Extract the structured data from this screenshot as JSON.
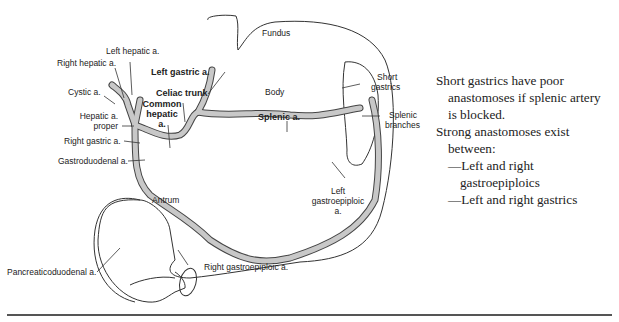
{
  "figure": {
    "regions": {
      "fundus": "Fundus",
      "body": "Body",
      "antrum": "Antrum"
    },
    "labels": {
      "left_hepatic": "Left hepatic a.",
      "right_hepatic": "Right hepatic a.",
      "left_gastric": "Left gastric a.",
      "cystic": "Cystic a.",
      "celiac_trunk": "Celiac trunk",
      "common_hepatic_1": "Common",
      "common_hepatic_2": "hepatic",
      "common_hepatic_3": "a.",
      "hepatic_proper_1": "Hepatic a.",
      "hepatic_proper_2": "proper",
      "right_gastric": "Right gastric a.",
      "gastroduodenal": "Gastroduodenal a.",
      "splenic": "Splenic a.",
      "short_gastrics_1": "Short",
      "short_gastrics_2": "gastrics",
      "splenic_branches_1": "Splenic",
      "splenic_branches_2": "branches",
      "left_gastroepiploic_1": "Left",
      "left_gastroepiploic_2": "gastroepiploic",
      "left_gastroepiploic_3": "a.",
      "pancreaticoduodenal": "Pancreaticoduodenal a.",
      "right_gastroepiploic": "Right gastroepiploic a."
    }
  },
  "notes": {
    "line1": "Short gastrics have poor",
    "line2": "anastomoses if splenic artery",
    "line3": "is blocked.",
    "line4": "Strong anastomoses exist",
    "line5": "between:",
    "line6": "—Left and right",
    "line7": "gastroepiploics",
    "line8": "—Left and right gastrics"
  },
  "colors": {
    "artery_fill": "#c8c8c8",
    "outline": "#333333",
    "text": "#222222"
  }
}
